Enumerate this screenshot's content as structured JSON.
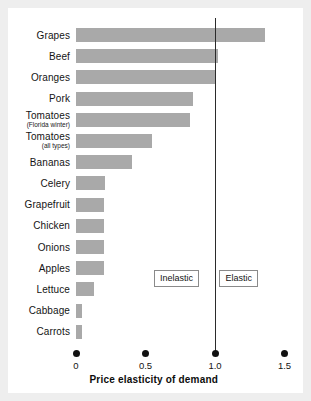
{
  "chart_data": {
    "type": "bar",
    "orientation": "horizontal",
    "title": "",
    "xlabel": "Price elasticity of demand",
    "ylabel": "",
    "xlim": [
      0,
      1.5
    ],
    "xticks": [
      "0",
      "0.5",
      "1.0",
      "1.5"
    ],
    "xtick_values": [
      0,
      0.5,
      1.0,
      1.5
    ],
    "grid": false,
    "legend": "none",
    "bar_color": "#a9a9a9",
    "reference_line": {
      "value": 1.0,
      "color": "#2b2b2b",
      "label": "unit elastic divider"
    },
    "annotations": [
      {
        "text": "Inelastic",
        "x": 0.72
      },
      {
        "text": "Elastic",
        "x": 1.19
      }
    ],
    "categories": [
      "Grapes",
      "Beef",
      "Oranges",
      "Pork",
      "Tomatoes",
      "Tomatoes",
      "Bananas",
      "Celery",
      "Grapefruit",
      "Chicken",
      "Onions",
      "Apples",
      "Lettuce",
      "Cabbage",
      "Carrots"
    ],
    "category_sublabels": [
      "",
      "",
      "",
      "",
      "(Florida winter)",
      "(all types)",
      "",
      "",
      "",
      "",
      "",
      "",
      "",
      "",
      ""
    ],
    "values": [
      1.36,
      1.02,
      1.0,
      0.84,
      0.82,
      0.55,
      0.4,
      0.21,
      0.2,
      0.2,
      0.2,
      0.2,
      0.13,
      0.04,
      0.04
    ]
  }
}
